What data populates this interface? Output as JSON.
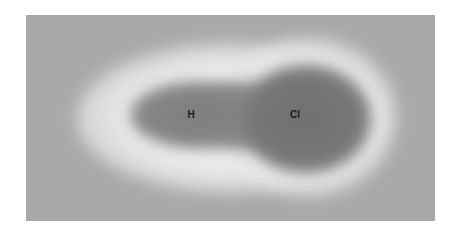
{
  "diagram": {
    "type": "electron-density-map",
    "molecule": "HCl",
    "atoms": [
      {
        "symbol": "H",
        "label": "H"
      },
      {
        "symbol": "Cl",
        "label": "Cl"
      }
    ],
    "colors": {
      "background": "#a9a9a9",
      "halo": "#f0f0f0",
      "density_h": "#7e7e7e",
      "density_cl": "#707070"
    }
  }
}
